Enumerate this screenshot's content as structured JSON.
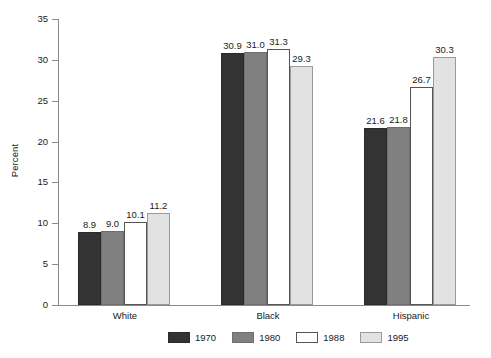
{
  "chart_data": {
    "type": "bar",
    "title": "",
    "subtitle": "",
    "xlabel": "",
    "ylabel": "Percent",
    "ylim": [
      0,
      35
    ],
    "yticks": [
      0,
      5,
      10,
      15,
      20,
      25,
      30,
      35
    ],
    "ytick_labels": [
      "0",
      "5",
      "10",
      "15",
      "20",
      "25",
      "30",
      "35"
    ],
    "grid": false,
    "legend_position": "bottom",
    "categories": [
      "White",
      "Black",
      "Hispanic"
    ],
    "series": [
      {
        "name": "1970",
        "color": "#333333",
        "values": [
          8.9,
          30.9,
          21.6
        ],
        "labels": [
          "8.9",
          "30.9",
          "21.6"
        ]
      },
      {
        "name": "1980",
        "color": "#808080",
        "values": [
          9.0,
          31.0,
          21.8
        ],
        "labels": [
          "9.0",
          "31.0",
          "21.8"
        ]
      },
      {
        "name": "1988",
        "color": "#ffffff",
        "values": [
          10.1,
          31.3,
          26.7
        ],
        "labels": [
          "10.1",
          "31.3",
          "26.7"
        ]
      },
      {
        "name": "1995",
        "color": "#e2e2e2",
        "values": [
          11.2,
          29.3,
          30.3
        ],
        "labels": [
          "11.2",
          "29.3",
          "30.3"
        ]
      }
    ]
  },
  "axis": {
    "y_label": "Percent",
    "tick_0": "0",
    "tick_5": "5",
    "tick_10": "10",
    "tick_15": "15",
    "tick_20": "20",
    "tick_25": "25",
    "tick_30": "30",
    "tick_35": "35"
  },
  "categories": {
    "white": "White",
    "black": "Black",
    "hispanic": "Hispanic"
  },
  "legend": {
    "items": [
      {
        "label": "1970"
      },
      {
        "label": "1980"
      },
      {
        "label": "1988"
      },
      {
        "label": "1995"
      }
    ]
  },
  "values": {
    "white": {
      "y1970": "8.9",
      "y1980": "9.0",
      "y1988": "10.1",
      "y1995": "11.2"
    },
    "black": {
      "y1970": "30.9",
      "y1980": "31.0",
      "y1988": "31.3",
      "y1995": "29.3"
    },
    "hispanic": {
      "y1970": "21.6",
      "y1980": "21.8",
      "y1988": "26.7",
      "y1995": "30.3"
    }
  }
}
